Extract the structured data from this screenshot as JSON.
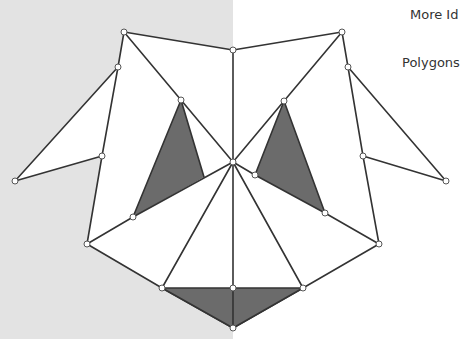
{
  "labels": {
    "title_partial": "More Id",
    "subtitle_partial": "Polygons"
  },
  "colors": {
    "left_background": "#e3e3e3",
    "right_background": "#ffffff",
    "stroke": "#333333",
    "shaded_fill": "#6b6b6b",
    "vertex_fill": "#ffffff"
  },
  "diagram": {
    "vertices": {
      "top_left": [
        124,
        32
      ],
      "top_center": [
        233,
        50
      ],
      "top_right": [
        342,
        32
      ],
      "left_upper": [
        118,
        67
      ],
      "right_upper": [
        348,
        67
      ],
      "left_tip": [
        15,
        181
      ],
      "right_tip": [
        446,
        181
      ],
      "left_mid": [
        102,
        156
      ],
      "right_mid": [
        363,
        156
      ],
      "inner_left_top": [
        181,
        100
      ],
      "inner_right_top": [
        284,
        101
      ],
      "center": [
        233,
        162
      ],
      "inner_right_small": [
        255,
        175
      ],
      "inner_left_bottom": [
        133,
        217
      ],
      "inner_right_bottom": [
        325,
        213
      ],
      "left_lower": [
        87,
        244
      ],
      "right_lower": [
        379,
        244
      ],
      "bottom_left": [
        162,
        288
      ],
      "bottom_center": [
        233,
        288
      ],
      "bottom_right": [
        303,
        288
      ],
      "bottom_tip": [
        233,
        328
      ]
    },
    "shaded_triangles": [
      [
        [
          181,
          100
        ],
        [
          133,
          217
        ],
        [
          204,
          177
        ]
      ],
      [
        [
          284,
          101
        ],
        [
          255,
          175
        ],
        [
          325,
          213
        ]
      ],
      [
        [
          162,
          288
        ],
        [
          303,
          288
        ],
        [
          233,
          328
        ]
      ]
    ]
  }
}
